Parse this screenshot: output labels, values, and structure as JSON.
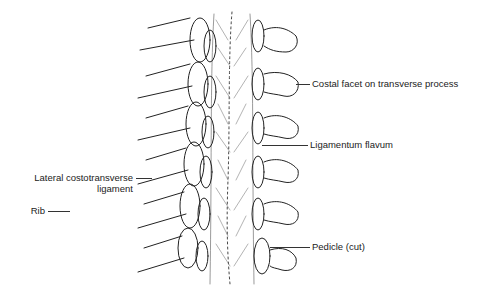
{
  "figure": {
    "labels": [
      {
        "id": "costal-facet",
        "text": "Costal facet on transverse process",
        "side": "right"
      },
      {
        "id": "ligamentum-flavum",
        "text": "Ligamentum flavum",
        "side": "right"
      },
      {
        "id": "lateral-costotransverse",
        "text": "Lateral costotransverse",
        "text2": "ligament",
        "side": "left"
      },
      {
        "id": "rib",
        "text": "Rib",
        "side": "left"
      },
      {
        "id": "pedicle",
        "text": "Pedicle (cut)",
        "side": "right"
      }
    ]
  }
}
